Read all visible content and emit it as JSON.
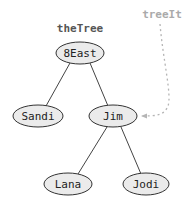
{
  "diagram": {
    "title_label": "theTree",
    "iterator_label": "treeIt",
    "colors": {
      "node_fill": "#ebebeb",
      "node_stroke": "#333333",
      "pointer": "#b5b5b5"
    },
    "nodes": [
      {
        "id": "root",
        "label": "8East",
        "cx": 80,
        "cy": 53
      },
      {
        "id": "left",
        "label": "Sandi",
        "cx": 38,
        "cy": 116
      },
      {
        "id": "right",
        "label": "Jim",
        "cx": 113,
        "cy": 116
      },
      {
        "id": "right-left",
        "label": "Lana",
        "cx": 68,
        "cy": 184
      },
      {
        "id": "right-right",
        "label": "Jodi",
        "cx": 146,
        "cy": 184
      }
    ],
    "edges": [
      {
        "from": "8East",
        "to": "Sandi"
      },
      {
        "from": "8East",
        "to": "Jim"
      },
      {
        "from": "Jim",
        "to": "Lana"
      },
      {
        "from": "Jim",
        "to": "Jodi"
      }
    ],
    "pointer": {
      "from": "treeIt",
      "to": "Jim"
    }
  }
}
